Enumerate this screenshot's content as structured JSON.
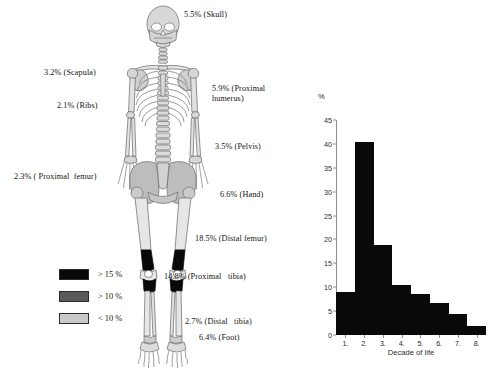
{
  "figure": {
    "skeleton_panel": {
      "title": "anatomical distribution of lesions",
      "callouts": [
        {
          "id": "skull",
          "text": "5.5% (Skull)",
          "x": 184,
          "y": 10,
          "wrap": false
        },
        {
          "id": "scapula",
          "text": "3.2% (Scapula)",
          "x": 44,
          "y": 68,
          "wrap": false
        },
        {
          "id": "proximal-humerus",
          "text": "5.9% (Proximal humerus)",
          "x": 212,
          "y": 84,
          "wrap": true
        },
        {
          "id": "ribs",
          "text": "2.1% (Ribs)",
          "x": 57,
          "y": 101,
          "wrap": false
        },
        {
          "id": "pelvis",
          "text": "3.5% (Pelvis)",
          "x": 215,
          "y": 142,
          "wrap": false
        },
        {
          "id": "proximal-femur",
          "text": "2.3% ( Proximal  femur)",
          "x": 14,
          "y": 172,
          "wrap": false
        },
        {
          "id": "hand",
          "text": "6.6% (Hand)",
          "x": 220,
          "y": 190,
          "wrap": false
        },
        {
          "id": "distal-femur",
          "text": "18.5% (Distal femur)",
          "x": 195,
          "y": 234,
          "wrap": false
        },
        {
          "id": "proximal-tibia",
          "text": "14.8% (Proximal   tibia)",
          "x": 164,
          "y": 272,
          "wrap": false
        },
        {
          "id": "distal-tibia",
          "text": "2.7% (Distal   tibia)",
          "x": 185,
          "y": 317,
          "wrap": false
        },
        {
          "id": "foot",
          "text": "6.4% (Foot)",
          "x": 199,
          "y": 333,
          "wrap": false
        }
      ],
      "site_percentages": {
        "skull": 5.5,
        "scapula": 3.2,
        "proximal_humerus": 5.9,
        "ribs": 2.1,
        "pelvis": 3.5,
        "proximal_femur": 2.3,
        "hand": 6.6,
        "distal_femur": 18.5,
        "proximal_tibia": 14.8,
        "distal_tibia": 2.7,
        "foot": 6.4
      }
    },
    "legend": {
      "items": [
        {
          "label": "> 15 %",
          "color": "#0a0a0a",
          "level": "high"
        },
        {
          "label": "> 10 %",
          "color": "#595959",
          "level": "medium"
        },
        {
          "label": "< 10 %",
          "color": "#c9c9c9",
          "level": "low"
        }
      ]
    }
  },
  "chart_data": {
    "type": "bar",
    "title": "",
    "xlabel": "Decade of life",
    "ylabel": "%",
    "unit_label": "%",
    "categories": [
      "1.",
      "2.",
      "3.",
      "4.",
      "5.",
      "6.",
      "7.",
      "8."
    ],
    "values": [
      9.0,
      40.4,
      18.8,
      10.4,
      8.5,
      6.8,
      4.4,
      1.8
    ],
    "ylim": [
      0,
      45
    ],
    "yticks": [
      0,
      5,
      10,
      15,
      20,
      25,
      30,
      35,
      40,
      45
    ],
    "grid": false,
    "legend": "none",
    "bar_color": "#090909"
  }
}
